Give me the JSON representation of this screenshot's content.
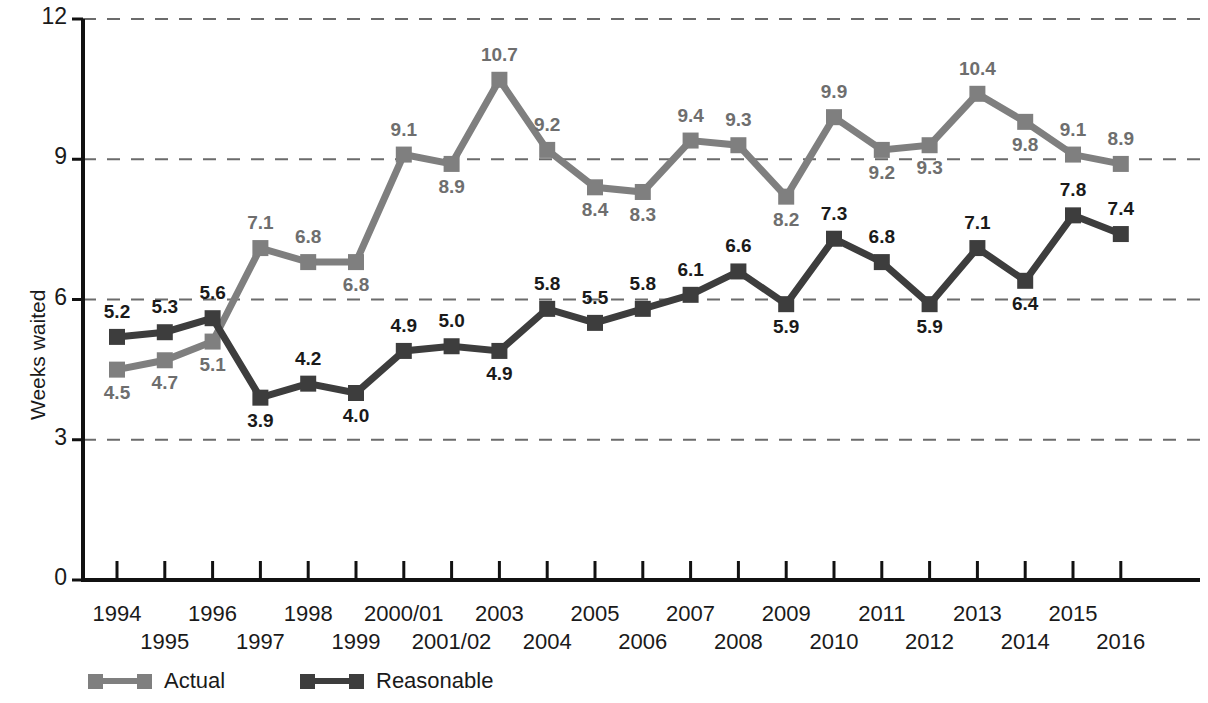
{
  "chart_data": {
    "type": "line",
    "title": "",
    "xlabel": "",
    "ylabel": "Weeks waited",
    "ylim": [
      0,
      12
    ],
    "yticks": [
      0,
      3,
      6,
      9,
      12
    ],
    "grid": "horizontal-dashed",
    "legend_position": "bottom-left",
    "categories": [
      "1994",
      "1995",
      "1996",
      "1997",
      "1998",
      "1999",
      "2000/01",
      "2001/02",
      "2003",
      "2004",
      "2005",
      "2006",
      "2007",
      "2008",
      "2009",
      "2010",
      "2011",
      "2012",
      "2013",
      "2014",
      "2015",
      "2016"
    ],
    "series": [
      {
        "name": "Actual",
        "color": "#7f7f7f",
        "values": [
          4.5,
          4.7,
          5.1,
          7.1,
          6.8,
          6.8,
          9.1,
          8.9,
          10.7,
          9.2,
          8.4,
          8.3,
          9.4,
          9.3,
          8.2,
          9.9,
          9.2,
          9.3,
          10.4,
          9.8,
          9.1,
          8.9
        ],
        "label_positions": [
          "below",
          "below",
          "below",
          "above",
          "above",
          "below",
          "above",
          "below",
          "above",
          "above",
          "below",
          "below",
          "above",
          "above",
          "below",
          "above",
          "below",
          "below",
          "above",
          "below",
          "above",
          "above"
        ]
      },
      {
        "name": "Reasonable",
        "color": "#3d3d3d",
        "values": [
          5.2,
          5.3,
          5.6,
          3.9,
          4.2,
          4.0,
          4.9,
          5.0,
          4.9,
          5.8,
          5.5,
          5.8,
          6.1,
          6.6,
          5.9,
          7.3,
          6.8,
          5.9,
          7.1,
          6.4,
          7.8,
          7.4
        ],
        "label_positions": [
          "above",
          "above",
          "above",
          "below",
          "above",
          "below",
          "above",
          "above",
          "below",
          "above",
          "above",
          "above",
          "above",
          "above",
          "below",
          "above",
          "above",
          "below",
          "above",
          "below",
          "above",
          "above"
        ]
      }
    ]
  },
  "axis": {
    "ytick_labels": [
      "0",
      "3",
      "6",
      "9",
      "12"
    ],
    "y_axis_title": "Weeks waited"
  },
  "legend": {
    "items": [
      {
        "label": "Actual",
        "color": "#7f7f7f"
      },
      {
        "label": "Reasonable",
        "color": "#3d3d3d"
      }
    ]
  }
}
